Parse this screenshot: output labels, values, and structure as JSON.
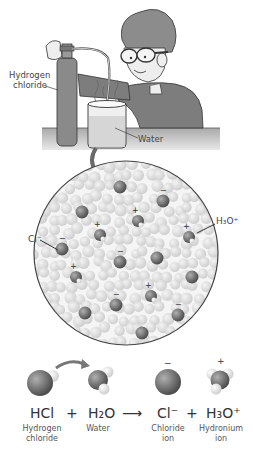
{
  "scene": {
    "labels": {
      "cylinder": "Hydrogen chloride",
      "cylinder_line1": "Hydrogen",
      "cylinder_line2": "chloride",
      "beaker": "Water"
    }
  },
  "magnified": {
    "labels": {
      "chloride_ion": "Cl⁻",
      "hydronium_ion": "H₃O⁺"
    },
    "charges": {
      "minus": "−",
      "plus": "+"
    }
  },
  "equation": {
    "terms": [
      {
        "formula": "HCl",
        "name_line1": "Hydrogen",
        "name_line2": "chloride"
      },
      {
        "formula": "H₂O",
        "name_line1": "Water",
        "name_line2": ""
      },
      {
        "formula": "Cl⁻",
        "name_line1": "Chloride",
        "name_line2": "ion"
      },
      {
        "formula": "H₃O⁺",
        "name_line1": "Hydronium",
        "name_line2": "ion"
      }
    ],
    "plus1": "+",
    "plus2": "+",
    "arrow": "⟶",
    "charge_minus": "−",
    "charge_plus": "+"
  },
  "colors": {
    "cylinder": "#8a8a8a",
    "shirt": "#7d7d7d",
    "skin": "#e6e6e6",
    "hair": "#8c8c8c",
    "table": "#b5b5b5",
    "circle_bg": "#f2f2f2",
    "water_molecule": "#d9d9d9",
    "ion": "#6a6a6a"
  }
}
